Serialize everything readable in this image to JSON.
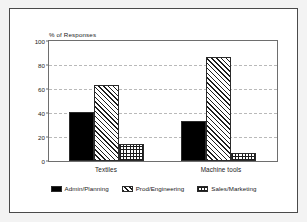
{
  "figure": {
    "background_color": "#f3f3f3",
    "frame_color": "#4a4a4a",
    "plot_background": "#ffffff"
  },
  "chart_data": {
    "type": "bar",
    "title": "",
    "subtitle": "",
    "ylabel": "% of Responses",
    "xlabel": "",
    "categories": [
      "Textiles",
      "Machine tools"
    ],
    "series": [
      {
        "name": "Admin/Planning",
        "values": [
          41,
          33
        ],
        "fill": "solid",
        "color": "#000000"
      },
      {
        "name": "Prod/Engineering",
        "values": [
          63,
          87
        ],
        "fill": "diagonal-hatch",
        "color": "#1d1d1d"
      },
      {
        "name": "Sales/Marketing",
        "values": [
          14,
          7
        ],
        "fill": "cross-hatch",
        "color": "#1d1d1d"
      }
    ],
    "ylim": [
      0,
      100
    ],
    "yticks": [
      0,
      20,
      40,
      60,
      80,
      100
    ],
    "ytick_labels": [
      "0",
      "20",
      "40",
      "60",
      "80",
      "100"
    ],
    "grid": true,
    "grid_style": "dashed",
    "grid_axis": "y",
    "legend_position": "bottom"
  },
  "axis": {
    "ytitle": "% of Responses",
    "ticks": [
      {
        "value": 100,
        "label": "100"
      },
      {
        "value": 80,
        "label": "80"
      },
      {
        "value": 60,
        "label": "60"
      },
      {
        "value": 40,
        "label": "40"
      },
      {
        "value": 20,
        "label": "20"
      },
      {
        "value": 0,
        "label": "0"
      }
    ]
  },
  "legend": {
    "items": [
      {
        "label": "Admin/Planning",
        "fill": "solid"
      },
      {
        "label": "Prod/Engineering",
        "fill": "diagonal-hatch"
      },
      {
        "label": "Sales/Marketing",
        "fill": "cross-hatch"
      }
    ]
  }
}
